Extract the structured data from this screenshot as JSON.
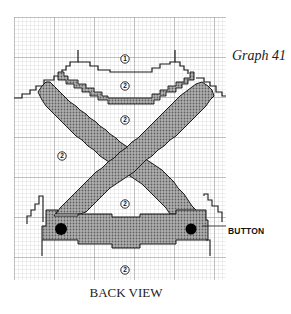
{
  "figure": {
    "title": "Graph 41",
    "caption": "BACK VIEW",
    "callout_label": "BUTTON"
  },
  "labels": [
    {
      "id": "color-1-top",
      "text": "1",
      "x": 125,
      "y": 59
    },
    {
      "id": "color-2-yoke",
      "text": "2",
      "x": 125,
      "y": 86
    },
    {
      "id": "color-2-inner-v",
      "text": "2",
      "x": 125,
      "y": 120
    },
    {
      "id": "color-2-left",
      "text": "2",
      "x": 62,
      "y": 156
    },
    {
      "id": "color-2-center",
      "text": "2",
      "x": 125,
      "y": 204
    },
    {
      "id": "color-2-bottom",
      "text": "2",
      "x": 125,
      "y": 270
    }
  ],
  "colors": {
    "grid_fine": "#c8c8c8",
    "grid_major": "#909090",
    "outline": "#1a1a1a",
    "fill_pattern": "#9a9a9a",
    "button": "#000000"
  },
  "grid": {
    "x0": 14,
    "y0": 17,
    "x1": 226,
    "y1": 280,
    "cell": 4,
    "major_every": 10
  }
}
